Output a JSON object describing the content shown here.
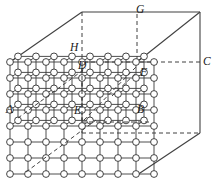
{
  "figure": {
    "width": 216,
    "height": 187,
    "background_color": "#ffffff",
    "line_color": "#404040",
    "node_fill_color": "#ffffff",
    "node_stroke_color": "#303030"
  },
  "labels": {
    "A": "A",
    "B": "B",
    "C": "C",
    "D": "D",
    "E": "E",
    "F": "F",
    "G": "G",
    "H": "H"
  },
  "label_positions": [
    {
      "key": "A",
      "text": "A",
      "x": 6,
      "y": 104
    },
    {
      "key": "B",
      "text": "B",
      "x": 137,
      "y": 104
    },
    {
      "key": "C",
      "text": "C",
      "x": 203,
      "y": 56
    },
    {
      "key": "D",
      "text": "D",
      "x": 78,
      "y": 60
    },
    {
      "key": "E",
      "text": "E",
      "x": 74,
      "y": 105
    },
    {
      "key": "F",
      "text": "F",
      "x": 140,
      "y": 67
    },
    {
      "key": "G",
      "text": "G",
      "x": 136,
      "y": 4
    },
    {
      "key": "H",
      "text": "H",
      "x": 70,
      "y": 42
    }
  ],
  "chart_data": {
    "type": "diagram",
    "cube": {
      "front_face": {
        "top_left": [
          10,
          62
        ],
        "top_right": [
          137,
          62
        ],
        "bottom_right": [
          137,
          175
        ],
        "bottom_left": [
          10,
          175
        ]
      },
      "back_face": {
        "top_left": [
          82,
          12
        ],
        "top_right": [
          200,
          12
        ],
        "bottom_right": [
          200,
          133
        ],
        "bottom_left": [
          82,
          133
        ]
      },
      "visible_edges": [
        [
          [
            10,
            62
          ],
          [
            82,
            12
          ]
        ],
        [
          [
            82,
            12
          ],
          [
            200,
            12
          ]
        ],
        [
          [
            200,
            12
          ],
          [
            200,
            133
          ]
        ],
        [
          [
            137,
            62
          ],
          [
            200,
            12
          ]
        ],
        [
          [
            137,
            175
          ],
          [
            200,
            133
          ]
        ]
      ],
      "hidden_edges": [
        [
          [
            82,
            12
          ],
          [
            82,
            133
          ]
        ],
        [
          [
            82,
            133
          ],
          [
            200,
            133
          ]
        ],
        [
          [
            10,
            62
          ],
          [
            137,
            62
          ]
        ],
        [
          [
            137,
            62
          ],
          [
            137,
            175
          ]
        ]
      ]
    },
    "lattice": {
      "rows": 8,
      "cols": 8,
      "spacing_x": 18,
      "spacing_y": 16,
      "origin": [
        10,
        62
      ],
      "shear_x": 8,
      "shear_y": -5.6,
      "depth_layers": 2,
      "node_radius": 3.4
    },
    "inner_cube_vertices": {
      "A": [
        10,
        112
      ],
      "B": [
        128,
        112
      ],
      "C": [
        200,
        62
      ],
      "D": [
        82,
        62
      ],
      "E": [
        82,
        112
      ],
      "F": [
        137,
        62
      ],
      "G": [
        137,
        12
      ],
      "H": [
        82,
        50
      ]
    }
  }
}
